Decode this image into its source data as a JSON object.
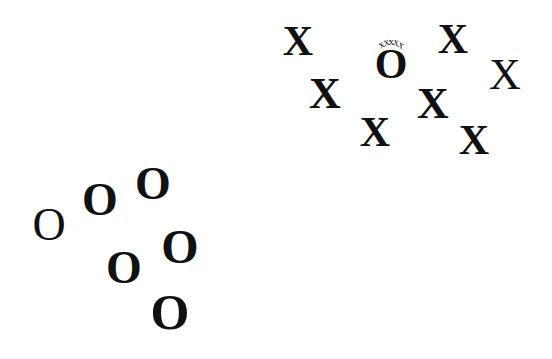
{
  "diagram": {
    "background": "#ffffff",
    "ink_color": "#111111",
    "x_cluster": {
      "items": [
        {
          "label": "X",
          "cx": 298,
          "cy": 41,
          "size": 42,
          "weight": "bold"
        },
        {
          "label": "X",
          "cx": 325,
          "cy": 94,
          "size": 44,
          "weight": "bold"
        },
        {
          "label": "X",
          "cx": 453,
          "cy": 39,
          "size": 42,
          "weight": "bold"
        },
        {
          "label": "X",
          "cx": 505,
          "cy": 75,
          "size": 44,
          "weight": "regular"
        },
        {
          "label": "X",
          "cx": 433,
          "cy": 104,
          "size": 44,
          "weight": "bold"
        },
        {
          "label": "X",
          "cx": 375,
          "cy": 132,
          "size": 42,
          "weight": "bold"
        },
        {
          "label": "X",
          "cx": 474,
          "cy": 140,
          "size": 42,
          "weight": "bold"
        }
      ],
      "embedded_o": {
        "label": "O",
        "cx": 391,
        "cy": 64,
        "size": 42,
        "weight": "bold",
        "crown": [
          "x",
          "x",
          "x",
          "x",
          "x"
        ]
      }
    },
    "o_cluster": {
      "items": [
        {
          "label": "O",
          "cx": 49,
          "cy": 225,
          "size": 46,
          "weight": "regular"
        },
        {
          "label": "O",
          "cx": 100,
          "cy": 200,
          "size": 46,
          "weight": "bold"
        },
        {
          "label": "O",
          "cx": 153,
          "cy": 184,
          "size": 46,
          "weight": "bold"
        },
        {
          "label": "O",
          "cx": 124,
          "cy": 268,
          "size": 46,
          "weight": "bold"
        },
        {
          "label": "O",
          "cx": 180,
          "cy": 247,
          "size": 48,
          "weight": "bold"
        },
        {
          "label": "O",
          "cx": 170,
          "cy": 312,
          "size": 50,
          "weight": "bold"
        }
      ]
    }
  }
}
